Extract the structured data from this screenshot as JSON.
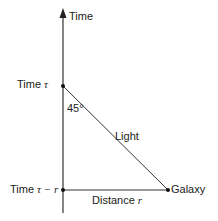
{
  "diagram": {
    "axis_label": "Time",
    "time_tau_label": "Time",
    "tau_symbol": "τ",
    "time_tau_minus_r_label": "Time",
    "tau_minus_r_symbol": "τ − r",
    "angle_label": "45°",
    "light_label": "Light",
    "galaxy_label": "Galaxy",
    "distance_label": "Distance",
    "distance_symbol": "r"
  }
}
